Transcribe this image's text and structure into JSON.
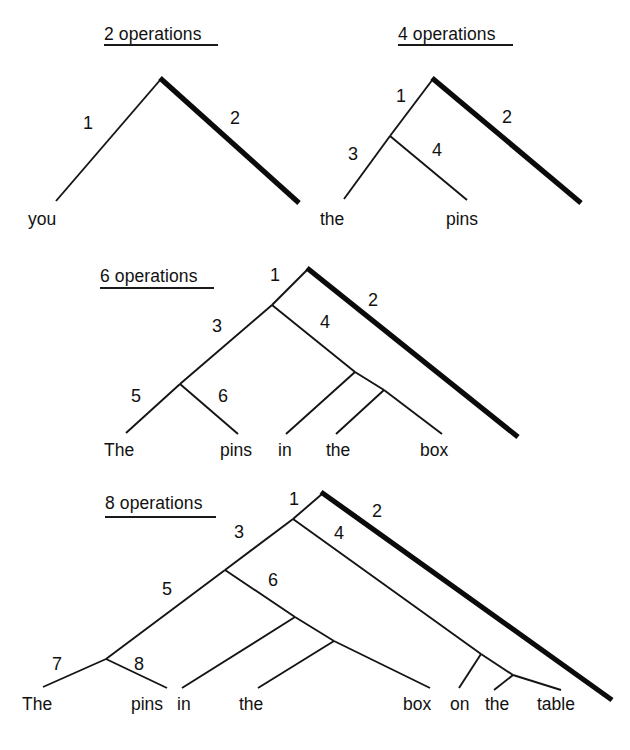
{
  "figure": {
    "caption_words": [
      "you",
      "the",
      "pins",
      "The",
      "in",
      "box",
      "on",
      "table"
    ],
    "background": "#ffffff",
    "ink": "#111111"
  },
  "trees": [
    {
      "id": "tree-2-operations",
      "title": "2 operations",
      "operation_labels": [
        "1",
        "2"
      ],
      "words": [
        "you"
      ],
      "bold_branch_label": "2"
    },
    {
      "id": "tree-4-operations",
      "title": "4 operations",
      "operation_labels": [
        "1",
        "2",
        "3",
        "4"
      ],
      "words": [
        "the",
        "pins"
      ],
      "bold_branch_label": "2"
    },
    {
      "id": "tree-6-operations",
      "title": "6 operations",
      "operation_labels": [
        "1",
        "2",
        "3",
        "4",
        "5",
        "6"
      ],
      "words": [
        "The",
        "pins",
        "in",
        "the",
        "box"
      ],
      "bold_branch_label": "2"
    },
    {
      "id": "tree-8-operations",
      "title": "8 operations",
      "operation_labels": [
        "1",
        "2",
        "3",
        "4",
        "5",
        "6",
        "7",
        "8"
      ],
      "words": [
        "The",
        "pins",
        "in",
        "the",
        "box",
        "on",
        "the",
        "table"
      ],
      "bold_branch_label": "2"
    }
  ],
  "tree1": {
    "title": "2 operations",
    "n1": "1",
    "n2": "2",
    "w1": "you"
  },
  "tree2": {
    "title": "4 operations",
    "n1": "1",
    "n2": "2",
    "n3": "3",
    "n4": "4",
    "w1": "the",
    "w2": "pins"
  },
  "tree3": {
    "title": "6 operations",
    "n1": "1",
    "n2": "2",
    "n3": "3",
    "n4": "4",
    "n5": "5",
    "n6": "6",
    "w1": "The",
    "w2": "pins",
    "w3": "in",
    "w4": "the",
    "w5": "box"
  },
  "tree4": {
    "title": "8 operations",
    "n1": "1",
    "n2": "2",
    "n3": "3",
    "n4": "4",
    "n5": "5",
    "n6": "6",
    "n7": "7",
    "n8": "8",
    "w1": "The",
    "w2": "pins",
    "w3": "in",
    "w4": "the",
    "w5": "box",
    "w6": "on",
    "w7": "the",
    "w8": "table"
  }
}
